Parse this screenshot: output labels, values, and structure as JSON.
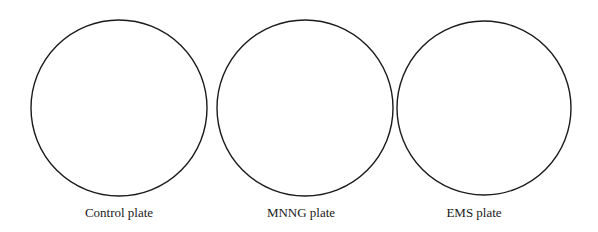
{
  "figure": {
    "stroke_color": "#1a1a1a",
    "background": "#ffffff",
    "plates": [
      {
        "label": "Control plate",
        "cx": 119,
        "cy": 108,
        "r": 88
      },
      {
        "label": "MNNG plate",
        "cx": 305,
        "cy": 108,
        "r": 88
      },
      {
        "label": "EMS plate",
        "cx": 484,
        "cy": 108,
        "r": 87
      }
    ]
  }
}
